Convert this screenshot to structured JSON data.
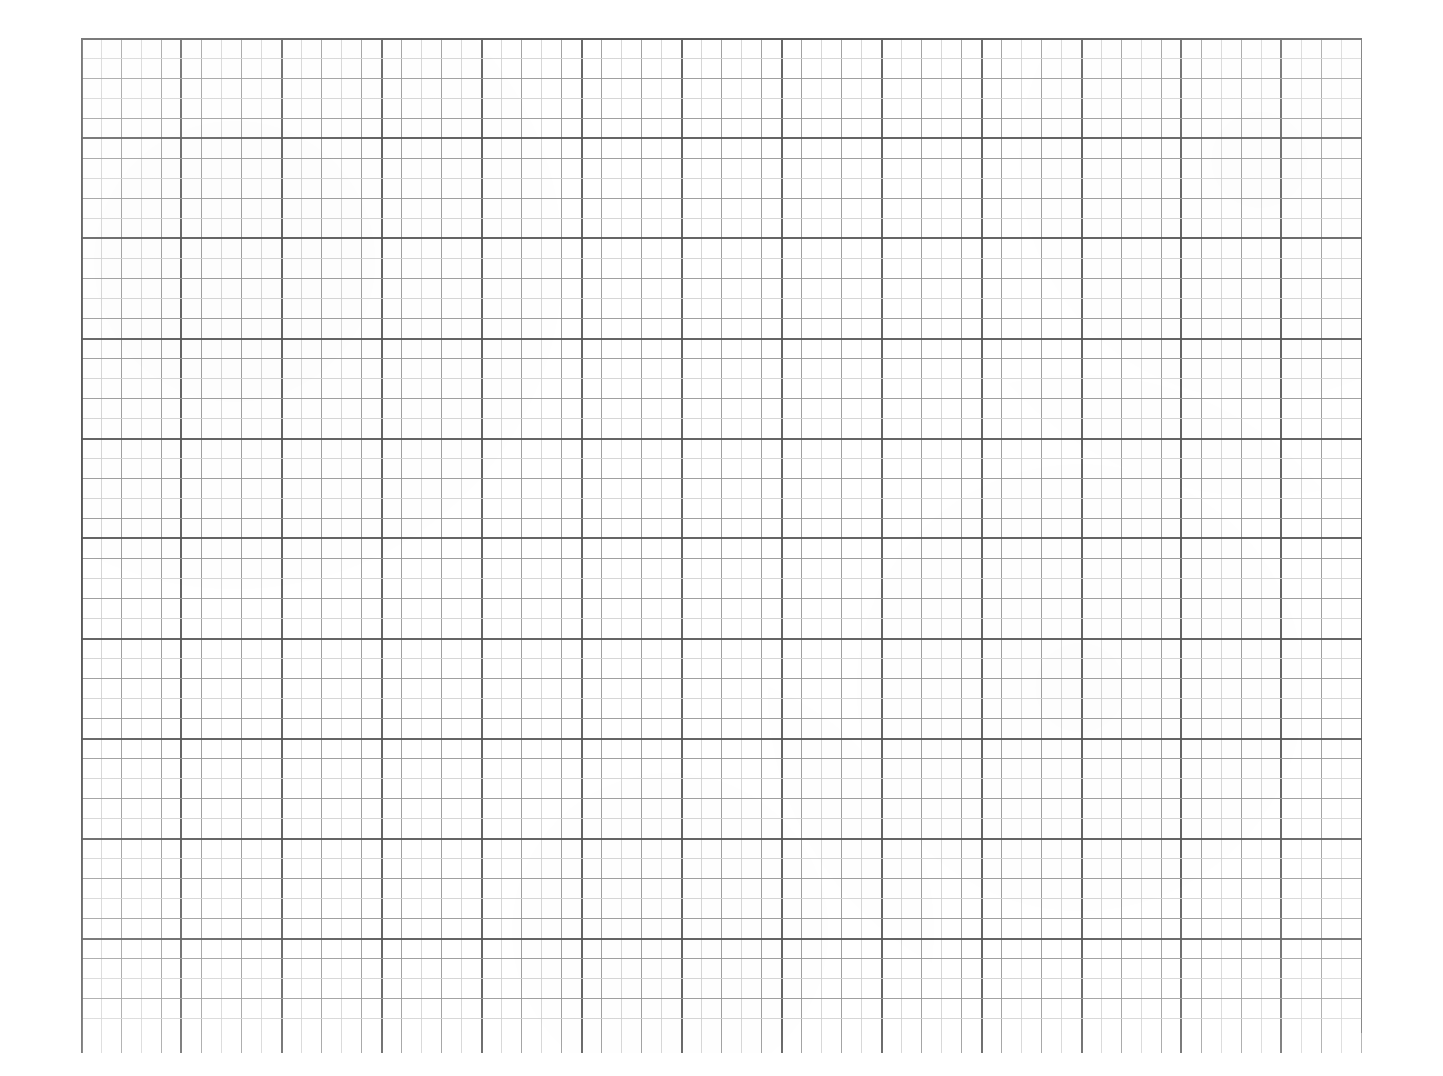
{
  "document": {
    "type": "graph-paper",
    "title": "Blank Graph Paper Sheet",
    "description": "Scanned blank engineering / quadrille graph paper with square grid",
    "background_color": "#ffffff",
    "canvas_width": 1443,
    "canvas_height": 1076,
    "text_content": "",
    "annotations": []
  },
  "grid": {
    "origin_x": 81,
    "origin_y": 38,
    "right_edge": 1362,
    "bottom_edge": 1033,
    "width": 1281,
    "height": 995,
    "minor_spacing": 20,
    "medium_spacing": 40,
    "major_spacing": 100,
    "minor_columns": 64,
    "minor_rows": 50,
    "major_columns": 12,
    "major_rows": 9,
    "minor_color": "#d2d2d2",
    "medium_color": "#9b9b9b",
    "major_color": "#585858",
    "border_color": "#555555",
    "minor_width": 1,
    "medium_width": 1,
    "major_width": 2,
    "border_width": 2,
    "has_left_border": true,
    "has_top_border": true,
    "has_right_border": true,
    "has_bottom_border": false,
    "bottom_overhang": 20
  },
  "chart_data": {
    "type": "table",
    "subtitle": "",
    "xlabel": "",
    "ylabel": "",
    "categories": [],
    "values": [],
    "series": [],
    "legend": [],
    "annotations": [],
    "grid": true,
    "grid_spacing_minor": 20,
    "grid_spacing_medium": 40,
    "grid_spacing_major": 100,
    "xlim": [
      0,
      64
    ],
    "ylim": [
      0,
      50
    ],
    "x_tick_labels": [],
    "y_tick_labels": [],
    "note": "Empty grid — no plotted data, no axis labels, no tick text visible in the image."
  }
}
